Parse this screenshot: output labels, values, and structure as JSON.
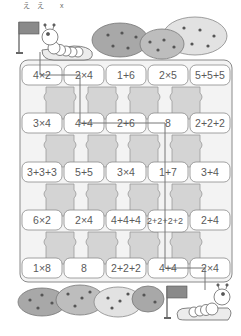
{
  "header": {
    "label": "ええ x"
  },
  "puzzle": {
    "start_flag_label": "start",
    "goal_flag_label": "goal",
    "grid": [
      [
        "4×2",
        "2×4",
        "1+6",
        "2×5",
        "5+5+5"
      ],
      [
        "3×4",
        "4+4",
        "2+6",
        "8",
        "2+2+2"
      ],
      [
        "3+3+3",
        "5+5",
        "3×4",
        "1+7",
        "3+4"
      ],
      [
        "6×2",
        "2×4",
        "4+4+4",
        "2+2+2+2",
        "2+4"
      ],
      [
        "1×8",
        "8",
        "2+2+2",
        "4+4",
        "2×4"
      ]
    ],
    "solution_path": [
      "4×2",
      "2×4",
      "4+4",
      "2+6",
      "8",
      "1+7",
      "2+2+2+2",
      "4+4",
      "2×4"
    ]
  },
  "colors": {
    "block_fill": "#d4d4d4",
    "cell_fill": "#ffffff",
    "outline": "#8a8a8a",
    "path_line": "#777777",
    "bush_dark": "#9a9a9a",
    "bush_mid": "#bdbdbd",
    "bush_light": "#e2e2e2",
    "berry": "#555555"
  }
}
